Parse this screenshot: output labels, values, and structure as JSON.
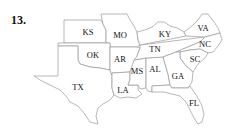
{
  "problem_number": "13.",
  "map": {
    "title": "Southeastern United States",
    "states": [
      {
        "abbr": "KS",
        "x": 88,
        "y": 33
      },
      {
        "abbr": "MO",
        "x": 120,
        "y": 36
      },
      {
        "abbr": "KY",
        "x": 165,
        "y": 35
      },
      {
        "abbr": "VA",
        "x": 203,
        "y": 29
      },
      {
        "abbr": "OK",
        "x": 93,
        "y": 56
      },
      {
        "abbr": "AR",
        "x": 120,
        "y": 60
      },
      {
        "abbr": "TN",
        "x": 155,
        "y": 50
      },
      {
        "abbr": "NC",
        "x": 205,
        "y": 45
      },
      {
        "abbr": "SC",
        "x": 195,
        "y": 60
      },
      {
        "abbr": "MS",
        "x": 137,
        "y": 72
      },
      {
        "abbr": "AL",
        "x": 155,
        "y": 70
      },
      {
        "abbr": "GA",
        "x": 178,
        "y": 77
      },
      {
        "abbr": "TX",
        "x": 78,
        "y": 88
      },
      {
        "abbr": "LA",
        "x": 123,
        "y": 91
      },
      {
        "abbr": "FL",
        "x": 194,
        "y": 104
      }
    ]
  }
}
